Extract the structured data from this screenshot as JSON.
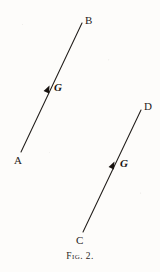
{
  "figure": {
    "caption": "Fig. 2.",
    "background_color": "#fdfcfa",
    "ink_color": "#211d1a"
  },
  "chart_data": {
    "type": "diagram",
    "title": "Fig. 2.",
    "lines": [
      {
        "name": "AB",
        "start_label": "A",
        "end_label": "B",
        "x1": 21,
        "y1": 152,
        "x2": 82,
        "y2": 23,
        "arrow": {
          "x": 48,
          "y": 88,
          "label": "G",
          "direction": "toward-B"
        }
      },
      {
        "name": "CD",
        "start_label": "C",
        "end_label": "D",
        "x1": 83,
        "y1": 232,
        "x2": 141,
        "y2": 110,
        "arrow": {
          "x": 113,
          "y": 164,
          "label": "G",
          "direction": "toward-D"
        }
      }
    ]
  },
  "labels": {
    "a": "A",
    "b": "B",
    "c": "C",
    "d": "D",
    "g1": "G",
    "g2": "G"
  }
}
